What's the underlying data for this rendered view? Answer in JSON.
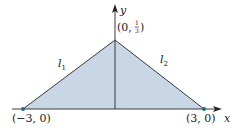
{
  "diagram": {
    "type": "triangle-region",
    "fill_color": "#c9d6e6",
    "line_color": "#3a3a3a",
    "point_color": "#1f6a8a",
    "axes": {
      "x_label": "x",
      "y_label": "y"
    },
    "points": [
      {
        "name": "left-vertex",
        "label": "(−3, 0)"
      },
      {
        "name": "right-vertex",
        "label": "(3, 0)"
      },
      {
        "name": "apex",
        "label_prefix": "(0, ",
        "frac_num": "1",
        "frac_den": "3",
        "label_suffix": ")"
      }
    ],
    "lines": [
      {
        "name": "l1",
        "label_base": "l",
        "label_sub": "1"
      },
      {
        "name": "l2",
        "label_base": "l",
        "label_sub": "2"
      }
    ]
  }
}
